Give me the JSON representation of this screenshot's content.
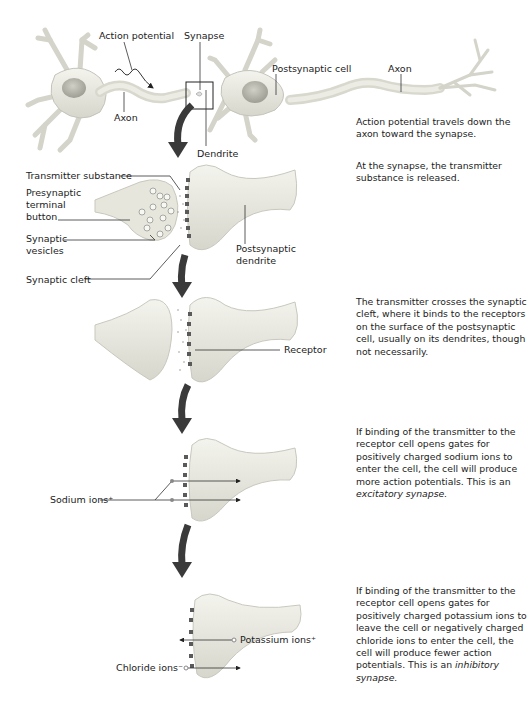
{
  "figure": {
    "top": {
      "labels": {
        "action_potential": "Action potential",
        "synapse": "Synapse",
        "postsynaptic_cell": "Postsynaptic cell",
        "axon_right": "Axon",
        "axon_left": "Axon",
        "dendrite": "Dendrite"
      },
      "description": "Action potential travels down the axon toward the synapse."
    },
    "step1": {
      "labels": {
        "transmitter_substance": "Transmitter substance",
        "presynaptic_terminal_button": "Presynaptic terminal button",
        "synaptic_vesicles": "Synaptic vesicles",
        "synaptic_cleft": "Synaptic cleft",
        "postsynaptic_dendrite": "Postsynaptic dendrite"
      },
      "description": "At the synapse, the transmitter substance is released."
    },
    "step2": {
      "labels": {
        "receptor": "Receptor"
      },
      "description": "The transmitter crosses the synaptic cleft, where it binds to the receptors on the surface of the postsynaptic cell, usually on its dendrites, though not necessarily."
    },
    "step3": {
      "labels": {
        "sodium_ions": "Sodium ions⁺"
      },
      "description": "If binding of the transmitter to the receptor cell opens gates for positively charged sodium ions to enter the cell, the cell will produce more action potentials. This is an",
      "description_italic": "excitatory synapse."
    },
    "step4": {
      "labels": {
        "potassium_ions": "Potassium ions⁺",
        "chloride_ions": "Chloride ions⁻"
      },
      "description": "If binding of the transmitter to the receptor cell opens gates for positively charged potassium ions to leave the cell or negatively charged chloride ions to enter the cell, the cell will produce fewer action potentials. This is an",
      "description_italic": "inhibitory synapse."
    },
    "colors": {
      "cell_fill": "#ecece4",
      "cell_shadow": "#c9c9bf",
      "nucleus": "#b8b8ae",
      "arrow": "#3a3a3a",
      "receptor": "#5a5a5a",
      "line": "#333333"
    }
  }
}
